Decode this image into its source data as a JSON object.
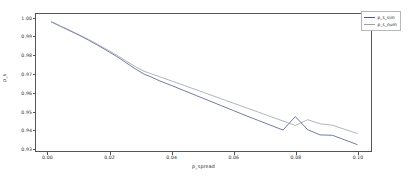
{
  "chart_data": {
    "type": "line",
    "title": "",
    "xlabel": "p_spread",
    "ylabel": "p_s",
    "xlim": [
      -0.004,
      0.1045
    ],
    "ylim": [
      0.9285,
      1.0025
    ],
    "grid": false,
    "legend_position": "upper right",
    "xticks": [
      "0.00",
      "0.02",
      "0.04",
      "0.06",
      "0.08",
      "0.10"
    ],
    "xtick_values": [
      0.0,
      0.02,
      0.04,
      0.06,
      0.08,
      0.1
    ],
    "yticks": [
      "1.00",
      "0.99",
      "0.98",
      "0.97",
      "0.96",
      "0.95",
      "0.94",
      "0.93"
    ],
    "ytick_values": [
      1.0,
      0.99,
      0.98,
      0.97,
      0.96,
      0.95,
      0.94,
      0.93
    ],
    "series": [
      {
        "name": "p_s_sim",
        "color": "#4c5a8a",
        "x": [
          0.001,
          0.004,
          0.007,
          0.01,
          0.013,
          0.016,
          0.019,
          0.022,
          0.025,
          0.028,
          0.031,
          0.033,
          0.036,
          0.04,
          0.044,
          0.048,
          0.052,
          0.056,
          0.06,
          0.064,
          0.068,
          0.072,
          0.076,
          0.08,
          0.084,
          0.088,
          0.092,
          0.096,
          0.1
        ],
        "y": [
          0.9982,
          0.9958,
          0.9934,
          0.991,
          0.9884,
          0.9856,
          0.9827,
          0.9797,
          0.9764,
          0.973,
          0.97,
          0.9687,
          0.9664,
          0.9638,
          0.9611,
          0.9584,
          0.9557,
          0.953,
          0.9503,
          0.9476,
          0.945,
          0.9424,
          0.9398,
          0.9471,
          0.94,
          0.9372,
          0.937,
          0.9345,
          0.932
        ]
      },
      {
        "name": "p_s_num",
        "color": "#9aa2ae",
        "x": [
          0.001,
          0.004,
          0.007,
          0.01,
          0.013,
          0.016,
          0.019,
          0.022,
          0.025,
          0.028,
          0.031,
          0.033,
          0.036,
          0.04,
          0.044,
          0.048,
          0.052,
          0.056,
          0.06,
          0.064,
          0.068,
          0.072,
          0.076,
          0.08,
          0.084,
          0.088,
          0.092,
          0.096,
          0.1
        ],
        "y": [
          0.9983,
          0.996,
          0.9937,
          0.9913,
          0.9888,
          0.9861,
          0.9833,
          0.9804,
          0.9773,
          0.9742,
          0.9716,
          0.9704,
          0.9686,
          0.9663,
          0.9639,
          0.9615,
          0.9591,
          0.9567,
          0.9543,
          0.9519,
          0.9495,
          0.9471,
          0.9447,
          0.9423,
          0.9454,
          0.9432,
          0.9424,
          0.9402,
          0.938
        ]
      }
    ]
  },
  "legend": {
    "entries": [
      {
        "label": "p_s_sim"
      },
      {
        "label": "p_s_num"
      }
    ]
  },
  "axes": {
    "xlabel": "p_spread",
    "ylabel": "p_s"
  }
}
